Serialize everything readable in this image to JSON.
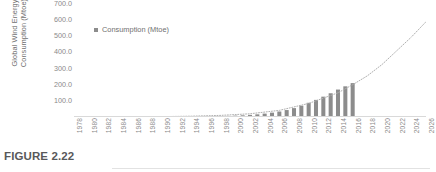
{
  "figure": {
    "caption": "FIGURE 2.22"
  },
  "legend": {
    "position": "top-left-inside",
    "entries": [
      {
        "label": "Consumption (Mtoe)",
        "color": "#8c8c8c",
        "marker": "square"
      }
    ]
  },
  "chart_data": {
    "type": "bar",
    "title": "",
    "subtitle": "",
    "xlabel": "",
    "ylabel": "Global Wind Energy Consumption (Mtoe)",
    "grid": false,
    "ylim": [
      0,
      700
    ],
    "ytick_labels": [
      "700.0",
      "600.0",
      "500.0",
      "400.0",
      "300.0",
      "200.0",
      "100.0"
    ],
    "ytick_values": [
      700,
      600,
      500,
      400,
      300,
      200,
      100
    ],
    "xlim": [
      1978,
      2026
    ],
    "xtick_labels": [
      "1978",
      "1980",
      "1982",
      "1984",
      "1986",
      "1988",
      "1990",
      "1992",
      "1994",
      "1996",
      "1998",
      "2000",
      "2002",
      "2004",
      "2006",
      "2008",
      "2010",
      "2012",
      "2014",
      "2016",
      "2018",
      "2020",
      "2022",
      "2024",
      "2026"
    ],
    "categories": [
      1978,
      1979,
      1980,
      1981,
      1982,
      1983,
      1984,
      1985,
      1986,
      1987,
      1988,
      1989,
      1990,
      1991,
      1992,
      1993,
      1994,
      1995,
      1996,
      1997,
      1998,
      1999,
      2000,
      2001,
      2002,
      2003,
      2004,
      2005,
      2006,
      2007,
      2008,
      2009,
      2010,
      2011,
      2012,
      2013,
      2014,
      2015,
      2016
    ],
    "series": [
      {
        "name": "Consumption (Mtoe)",
        "color": "#8c8c8c",
        "values": [
          0.0,
          0.0,
          0.0,
          0.0,
          0.0,
          0.1,
          0.1,
          0.2,
          0.3,
          0.4,
          0.5,
          0.7,
          0.9,
          1.1,
          1.4,
          1.7,
          2.2,
          2.8,
          3.4,
          4.2,
          5.3,
          6.8,
          8.5,
          10.5,
          13.0,
          16.5,
          21.0,
          27.0,
          34.0,
          43.0,
          55.0,
          70.0,
          88.0,
          106.0,
          126.0,
          147.0,
          170.0,
          190.0,
          210.0
        ]
      }
    ],
    "annotations": [
      {
        "type": "trendline",
        "style": "dotted",
        "color": "#b0b0b0",
        "label": "exponential trend extrapolated to 2026",
        "x": [
          1978,
          1982,
          1986,
          1990,
          1994,
          1998,
          2002,
          2006,
          2010,
          2014,
          2016,
          2018,
          2020,
          2022,
          2024,
          2026
        ],
        "y": [
          0.3,
          0.6,
          1.2,
          2.4,
          5.0,
          10.0,
          20.0,
          41.0,
          84.0,
          150.0,
          200.0,
          255.0,
          325.0,
          410.0,
          495.0,
          590.0
        ]
      }
    ]
  }
}
